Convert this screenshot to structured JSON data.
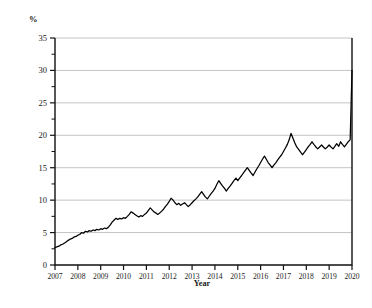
{
  "chart_data": {
    "type": "line",
    "title": "",
    "subtitle": "",
    "xlabel": "Year",
    "ylabel": "%",
    "xlim": [
      2007,
      2020
    ],
    "ylim": [
      0,
      35
    ],
    "grid": true,
    "legend": null,
    "y_ticks": [
      0,
      5,
      10,
      15,
      20,
      25,
      30,
      35
    ],
    "y_tick_labels": [
      "0",
      "5",
      "10",
      "15",
      "20",
      "25",
      "30",
      "35"
    ],
    "y_minor_ticks": [
      2.5,
      7.5,
      12.5,
      17.5,
      22.5,
      27.5,
      32.5
    ],
    "x_ticks": [
      2007,
      2008,
      2009,
      2010,
      2011,
      2012,
      2013,
      2014,
      2015,
      2016,
      2017,
      2018,
      2019,
      2020
    ],
    "x_tick_labels": [
      "2007",
      "2008",
      "2009",
      "2010",
      "2011",
      "2012",
      "2013",
      "2014",
      "2015",
      "2016",
      "2017",
      "2018",
      "2019",
      "2020"
    ],
    "series": [
      {
        "name": "series-1",
        "color": "#000000",
        "x": [
          2007.0,
          2007.08,
          2007.17,
          2007.25,
          2007.33,
          2007.42,
          2007.5,
          2007.58,
          2007.67,
          2007.75,
          2007.83,
          2007.92,
          2008.0,
          2008.08,
          2008.17,
          2008.25,
          2008.33,
          2008.42,
          2008.5,
          2008.58,
          2008.67,
          2008.75,
          2008.83,
          2008.92,
          2009.0,
          2009.08,
          2009.17,
          2009.25,
          2009.33,
          2009.42,
          2009.5,
          2009.58,
          2009.67,
          2009.75,
          2009.83,
          2009.92,
          2010.0,
          2010.08,
          2010.17,
          2010.25,
          2010.33,
          2010.42,
          2010.5,
          2010.58,
          2010.67,
          2010.75,
          2010.83,
          2010.92,
          2011.0,
          2011.08,
          2011.17,
          2011.25,
          2011.33,
          2011.42,
          2011.5,
          2011.58,
          2011.67,
          2011.75,
          2011.83,
          2011.92,
          2012.0,
          2012.08,
          2012.17,
          2012.25,
          2012.33,
          2012.42,
          2012.5,
          2012.58,
          2012.67,
          2012.75,
          2012.83,
          2012.92,
          2013.0,
          2013.08,
          2013.17,
          2013.25,
          2013.33,
          2013.42,
          2013.5,
          2013.58,
          2013.67,
          2013.75,
          2013.83,
          2013.92,
          2014.0,
          2014.08,
          2014.17,
          2014.25,
          2014.33,
          2014.42,
          2014.5,
          2014.58,
          2014.67,
          2014.75,
          2014.83,
          2014.92,
          2015.0,
          2015.08,
          2015.17,
          2015.25,
          2015.33,
          2015.42,
          2015.5,
          2015.58,
          2015.67,
          2015.75,
          2015.83,
          2015.92,
          2016.0,
          2016.08,
          2016.17,
          2016.25,
          2016.33,
          2016.42,
          2016.5,
          2016.58,
          2016.67,
          2016.75,
          2016.83,
          2016.92,
          2017.0,
          2017.08,
          2017.17,
          2017.25,
          2017.33,
          2017.42,
          2017.5,
          2017.58,
          2017.67,
          2017.75,
          2017.83,
          2017.92,
          2018.0,
          2018.08,
          2018.17,
          2018.25,
          2018.33,
          2018.42,
          2018.5,
          2018.58,
          2018.67,
          2018.75,
          2018.83,
          2018.92,
          2019.0,
          2019.08,
          2019.17,
          2019.25,
          2019.33,
          2019.42,
          2019.5,
          2019.58,
          2019.67,
          2019.75,
          2019.83,
          2019.92,
          2020.0
        ],
        "y": [
          2.7,
          2.8,
          2.9,
          3.1,
          3.2,
          3.4,
          3.6,
          3.8,
          4.0,
          4.1,
          4.3,
          4.4,
          4.6,
          4.7,
          5.0,
          4.9,
          5.2,
          5.1,
          5.3,
          5.2,
          5.4,
          5.3,
          5.5,
          5.4,
          5.6,
          5.5,
          5.7,
          5.6,
          5.8,
          6.2,
          6.6,
          6.9,
          7.2,
          7.0,
          7.2,
          7.1,
          7.3,
          7.2,
          7.5,
          7.8,
          8.2,
          8.0,
          7.8,
          7.6,
          7.4,
          7.6,
          7.5,
          7.8,
          8.0,
          8.4,
          8.8,
          8.5,
          8.2,
          8.0,
          7.8,
          8.0,
          8.3,
          8.6,
          9.0,
          9.4,
          9.8,
          10.3,
          10.0,
          9.6,
          9.3,
          9.5,
          9.2,
          9.4,
          9.6,
          9.3,
          9.0,
          9.3,
          9.6,
          9.9,
          10.2,
          10.5,
          10.9,
          11.3,
          10.9,
          10.5,
          10.2,
          10.6,
          11.0,
          11.4,
          11.8,
          12.4,
          13.0,
          12.6,
          12.2,
          11.8,
          11.4,
          11.8,
          12.2,
          12.6,
          13.0,
          13.4,
          13.0,
          13.4,
          13.8,
          14.2,
          14.6,
          15.0,
          14.6,
          14.2,
          13.8,
          14.3,
          14.8,
          15.3,
          15.8,
          16.3,
          16.8,
          16.3,
          15.8,
          15.4,
          15.0,
          15.4,
          15.8,
          16.2,
          16.6,
          17.0,
          17.5,
          18.0,
          18.6,
          19.3,
          20.3,
          19.5,
          18.8,
          18.2,
          17.8,
          17.4,
          17.0,
          17.4,
          17.8,
          18.2,
          18.6,
          19.0,
          18.6,
          18.2,
          17.9,
          18.2,
          18.5,
          18.2,
          17.9,
          18.2,
          18.5,
          18.2,
          17.9,
          18.3,
          18.7,
          18.3,
          19.0,
          18.6,
          18.2,
          18.6,
          19.0,
          19.3,
          30.0
        ]
      }
    ]
  },
  "axes": {
    "y_axis_unit_label": "%",
    "x_axis_title": "Year"
  }
}
